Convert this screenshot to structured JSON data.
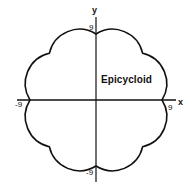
{
  "diagram": {
    "title": "Epicycloid",
    "axes": {
      "x_label": "x",
      "y_label": "y"
    },
    "ticks": {
      "top": "9",
      "bottom": "-9",
      "left": "-9",
      "right": "9"
    },
    "curve": {
      "type": "epicycloid",
      "cusps": 8,
      "cusp_radius_units": 9,
      "stroke_color": "#111111"
    },
    "colors": {
      "background": "#ffffff",
      "ink": "#111111"
    }
  }
}
